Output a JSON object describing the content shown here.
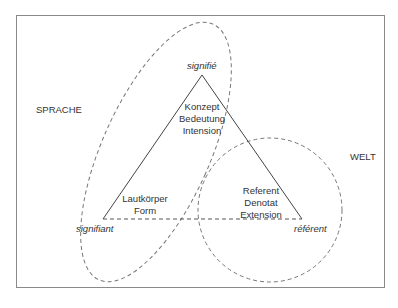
{
  "diagram": {
    "type": "semiotic-triangle",
    "regions": {
      "language": "SPRACHE",
      "world": "WELT"
    },
    "vertices": {
      "top": {
        "term": "signifié",
        "lines": [
          "Konzept",
          "Bedeutung",
          "Intension"
        ]
      },
      "left": {
        "term": "signifiant",
        "lines": [
          "Lautkörper",
          "Form"
        ]
      },
      "right": {
        "term": "référent",
        "lines": [
          "Referent",
          "Denotat",
          "Extension"
        ]
      }
    },
    "edges": [
      {
        "from": "signifiant",
        "to": "signifié",
        "style": "solid"
      },
      {
        "from": "signifié",
        "to": "référent",
        "style": "solid"
      },
      {
        "from": "signifiant",
        "to": "référent",
        "style": "dashed"
      }
    ],
    "enclosures": [
      {
        "name": "sprache-ellipse",
        "shape": "ellipse",
        "style": "dashed"
      },
      {
        "name": "welt-circle",
        "shape": "circle",
        "style": "dashed"
      }
    ],
    "colors": {
      "line": "#444444",
      "dash": "#777777",
      "frame": "#8a8a8a",
      "text": "#333333"
    }
  }
}
